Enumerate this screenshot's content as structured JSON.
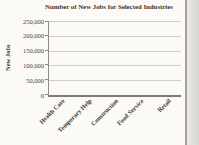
{
  "chart_data": {
    "type": "bar",
    "title": "Number of New Jobs for Selected Industries",
    "ylabel": "New Jobs",
    "xlabel": "",
    "categories": [
      "Health Care",
      "Temporary Help",
      "Construction",
      "Food Service",
      "Retail"
    ],
    "values": [
      null,
      null,
      null,
      null,
      null
    ],
    "bars_plotted": false,
    "ylim": [
      0,
      250000
    ],
    "ytick_interval": 50000,
    "yticks": [
      "250,000",
      "200,000",
      "150,000",
      "100,000",
      "50,000",
      "0"
    ],
    "grid": true,
    "legend": false
  },
  "colors": {
    "background": "#fbfaf6",
    "title_text": "#3c362e",
    "tick_text": "#45403a",
    "gridline": "#d0cdc7",
    "axis": "#7d7a73",
    "page_edge_line": "#a3a09a",
    "page_edge_strip": "#d8d6d1"
  }
}
